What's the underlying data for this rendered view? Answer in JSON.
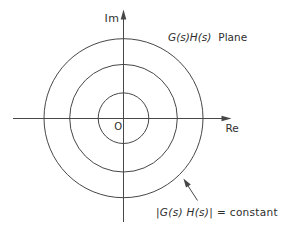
{
  "diagram": {
    "colors": {
      "background": "#ffffff",
      "line": "#474747",
      "text": "#2e2e2e"
    },
    "center": {
      "x": 123.5,
      "y": 118.2
    },
    "circles": [
      25.3,
      53.8,
      79.5
    ],
    "axes": {
      "im_label": "Im",
      "re_label": "Re",
      "origin_label": "O"
    },
    "title": {
      "math": "G(s)H(s)",
      "word": "Plane"
    },
    "annotation": {
      "math": "|G(s) H(s)|",
      "rest": "= constant"
    }
  }
}
